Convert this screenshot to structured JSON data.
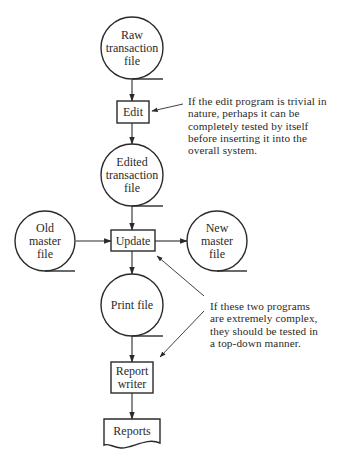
{
  "nodes": [
    {
      "id": "raw",
      "type": "file",
      "cx": 132,
      "cy": 48,
      "r": 31,
      "lines": [
        "Raw",
        "transaction",
        "file"
      ]
    },
    {
      "id": "edit",
      "type": "process",
      "x": 117,
      "y": 101,
      "w": 32,
      "h": 22,
      "lines": [
        "Edit"
      ]
    },
    {
      "id": "edited",
      "type": "file",
      "cx": 132,
      "cy": 175,
      "r": 31,
      "lines": [
        "Edited",
        "transaction",
        "file"
      ]
    },
    {
      "id": "old_master",
      "type": "file",
      "cx": 45,
      "cy": 241,
      "r": 30,
      "lines": [
        "Old",
        "master",
        "file"
      ]
    },
    {
      "id": "update",
      "type": "process",
      "x": 111,
      "y": 230,
      "w": 44,
      "h": 21,
      "lines": [
        "Update"
      ]
    },
    {
      "id": "new_master",
      "type": "file",
      "cx": 217,
      "cy": 241,
      "r": 30,
      "lines": [
        "New",
        "master",
        "file"
      ]
    },
    {
      "id": "print",
      "type": "file",
      "cx": 132,
      "cy": 305,
      "r": 31,
      "lines": [
        "Print file"
      ]
    },
    {
      "id": "report_writer",
      "type": "process",
      "x": 111,
      "y": 362,
      "w": 42,
      "h": 31,
      "lines": [
        "Report",
        "writer"
      ]
    },
    {
      "id": "reports",
      "type": "document",
      "x": 104,
      "y": 419,
      "w": 56,
      "h": 28,
      "lines": [
        "Reports"
      ]
    }
  ],
  "edges": [
    {
      "from": [
        132,
        80
      ],
      "to": [
        132,
        101
      ]
    },
    {
      "from": [
        132,
        123
      ],
      "to": [
        132,
        144
      ]
    },
    {
      "from": [
        132,
        206
      ],
      "to": [
        132,
        230
      ]
    },
    {
      "from": [
        76,
        241
      ],
      "to": [
        111,
        241
      ]
    },
    {
      "from": [
        155,
        241
      ],
      "to": [
        187,
        241
      ]
    },
    {
      "from": [
        132,
        251
      ],
      "to": [
        132,
        274
      ]
    },
    {
      "from": [
        132,
        336
      ],
      "to": [
        132,
        362
      ]
    },
    {
      "from": [
        132,
        393
      ],
      "to": [
        132,
        419
      ]
    }
  ],
  "annotation_arrows": [
    {
      "from": [
        183,
        104
      ],
      "to": [
        152,
        111
      ]
    },
    {
      "from": [
        204,
        296
      ],
      "to": [
        157,
        256
      ]
    },
    {
      "from": [
        204,
        311
      ],
      "to": [
        160,
        357
      ]
    }
  ],
  "notes": [
    {
      "id": "edit_note",
      "x": 188,
      "y": 95,
      "text": "If the edit program is trivial in\nnature, perhaps it can be\ncompletely tested by itself\nbefore inserting it into the\noverall system."
    },
    {
      "id": "complex_note",
      "x": 210,
      "y": 300,
      "text": "If these two programs\nare extremely complex,\nthey should be tested in\na top-down manner."
    }
  ],
  "colors": {
    "ink": "#2a2a2a",
    "background": "#ffffff"
  }
}
